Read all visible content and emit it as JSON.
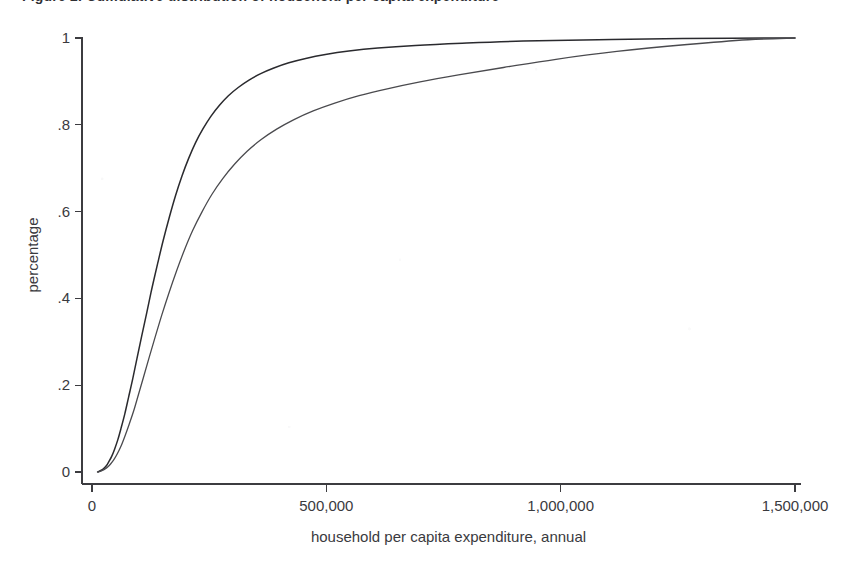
{
  "figure": {
    "caption": "Figure 2. Cumulative distribution of household per capita expenditure",
    "background_color": "#ffffff"
  },
  "chart_data": {
    "type": "line",
    "title": "",
    "xlabel": "household per capita expenditure, annual",
    "ylabel": "percentage",
    "xlim": [
      0,
      1500000
    ],
    "ylim": [
      0,
      1
    ],
    "grid": false,
    "legend": "none",
    "xticks": [
      0,
      500000,
      1000000,
      1500000
    ],
    "xtick_labels": [
      "0",
      "500,000",
      "1,000,000",
      "1,500,000"
    ],
    "yticks": [
      0,
      0.2,
      0.4,
      0.6,
      0.8,
      1
    ],
    "ytick_labels": [
      "0",
      ".2",
      ".4",
      ".6",
      ".8",
      "1"
    ],
    "series": [
      {
        "name": "curve-1",
        "color": "#2a2a2e",
        "line_width": 1.5,
        "x": [
          12000,
          20000,
          26000,
          31000,
          36000,
          42000,
          48000,
          55000,
          62000,
          70000,
          78000,
          87000,
          96000,
          106000,
          117000,
          128000,
          140000,
          152000,
          165000,
          178000,
          192000,
          206000,
          221000,
          237000,
          254000,
          272000,
          291000,
          312000,
          335000,
          360000,
          388000,
          420000,
          456000,
          498000,
          548000,
          610000,
          690000,
          790000,
          920000,
          1080000,
          1260000,
          1500000
        ],
        "y": [
          0.0,
          0.004,
          0.009,
          0.015,
          0.024,
          0.036,
          0.052,
          0.074,
          0.101,
          0.134,
          0.172,
          0.215,
          0.262,
          0.313,
          0.368,
          0.424,
          0.48,
          0.534,
          0.587,
          0.636,
          0.682,
          0.722,
          0.759,
          0.791,
          0.82,
          0.845,
          0.867,
          0.886,
          0.903,
          0.918,
          0.931,
          0.943,
          0.953,
          0.962,
          0.97,
          0.977,
          0.983,
          0.988,
          0.993,
          0.996,
          0.999,
          1.0
        ]
      },
      {
        "name": "curve-2",
        "color": "#4a4a4e",
        "line_width": 1.3,
        "x": [
          13000,
          21000,
          28000,
          34000,
          40000,
          47000,
          54000,
          62000,
          70000,
          79000,
          89000,
          99000,
          110000,
          122000,
          135000,
          149000,
          164000,
          180000,
          197000,
          215000,
          235000,
          256000,
          279000,
          304000,
          331000,
          361000,
          394000,
          431000,
          472000,
          518000,
          570000,
          630000,
          700000,
          782000,
          878000,
          990000,
          1120000,
          1270000,
          1400000,
          1500000
        ],
        "y": [
          0.0,
          0.003,
          0.007,
          0.012,
          0.019,
          0.029,
          0.042,
          0.06,
          0.082,
          0.109,
          0.141,
          0.178,
          0.219,
          0.264,
          0.312,
          0.362,
          0.412,
          0.462,
          0.511,
          0.557,
          0.6,
          0.64,
          0.676,
          0.709,
          0.739,
          0.766,
          0.79,
          0.812,
          0.832,
          0.85,
          0.867,
          0.883,
          0.899,
          0.915,
          0.932,
          0.951,
          0.969,
          0.985,
          0.996,
          1.0
        ]
      }
    ]
  }
}
